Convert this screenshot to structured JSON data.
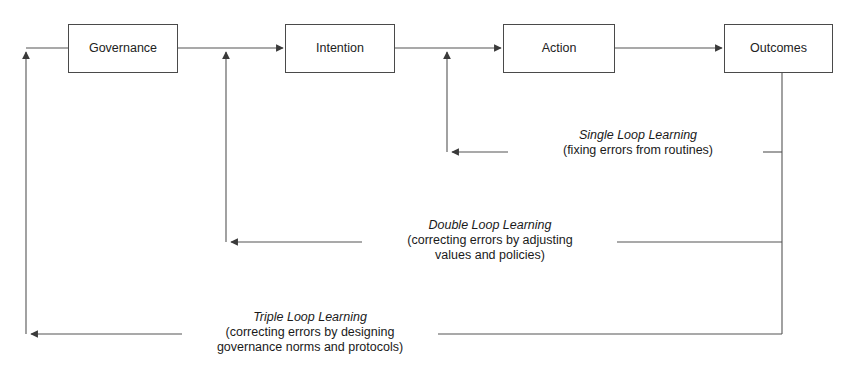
{
  "diagram": {
    "colors": {
      "line": "#555555",
      "box_border": "#4a4a4a",
      "text": "#1a1a1a",
      "background": "#ffffff"
    },
    "nodes": [
      {
        "id": "governance",
        "label": "Governance",
        "x": 68,
        "y": 24,
        "w": 110,
        "h": 49
      },
      {
        "id": "intention",
        "label": "Intention",
        "x": 285,
        "y": 24,
        "w": 110,
        "h": 49
      },
      {
        "id": "action",
        "label": "Action",
        "x": 503,
        "y": 24,
        "w": 112,
        "h": 49
      },
      {
        "id": "outcomes",
        "label": "Outcomes",
        "x": 724,
        "y": 24,
        "w": 109,
        "h": 49
      }
    ],
    "loops": [
      {
        "id": "single-loop",
        "title": "Single Loop Learning",
        "subtitle": "(fixing errors from routines)",
        "feedback_from": "Outcomes",
        "feedback_to": "Action",
        "y": 152
      },
      {
        "id": "double-loop",
        "title": "Double Loop Learning",
        "subtitle_line1": "(correcting errors by adjusting",
        "subtitle_line2": "values and policies)",
        "feedback_from": "Outcomes",
        "feedback_to": "Intention",
        "y": 242
      },
      {
        "id": "triple-loop",
        "title": "Triple Loop Learning",
        "subtitle_line1": "(correcting errors by designing",
        "subtitle_line2": "governance norms and protocols)",
        "feedback_from": "Outcomes",
        "feedback_to": "Governance",
        "y": 334
      }
    ]
  }
}
